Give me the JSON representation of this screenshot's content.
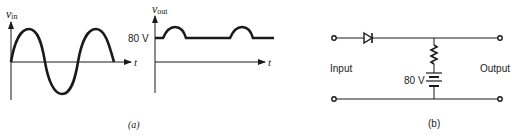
{
  "figure_a": {
    "caption": "(a)",
    "input_graph": {
      "ylabel_main": "v",
      "ylabel_sub": "in",
      "xlabel": "t",
      "waveform": "sine"
    },
    "output_graph": {
      "ylabel_main": "v",
      "ylabel_sub": "out",
      "xlabel": "t",
      "level_label": "80 V",
      "waveform": "clipped at 80 V with positive peaks above"
    }
  },
  "figure_b": {
    "caption": "(b)",
    "input_label": "Input",
    "output_label": "Output",
    "battery_label": "80 V",
    "components": [
      "diode",
      "resistor",
      "battery"
    ]
  },
  "colors": {
    "stroke": "#1a1a1a",
    "text": "#222222",
    "background": "#ffffff"
  }
}
